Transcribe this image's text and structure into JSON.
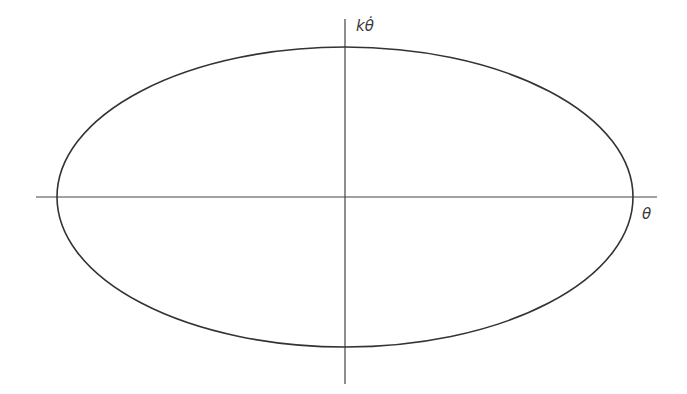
{
  "diagram": {
    "type": "phase-portrait",
    "axes": {
      "x": {
        "label": "θ",
        "x1": 36,
        "y1": 197,
        "x2": 657,
        "y2": 197
      },
      "y": {
        "label": "kθ̇",
        "x1": 345,
        "y1": 19,
        "x2": 345,
        "y2": 384
      }
    },
    "ellipse": {
      "cx": 345,
      "cy": 197,
      "rx": 288,
      "ry": 150
    },
    "colors": {
      "stroke": "#333333",
      "axis": "#444444",
      "label": "#3a3a3a",
      "background": "#ffffff"
    }
  }
}
